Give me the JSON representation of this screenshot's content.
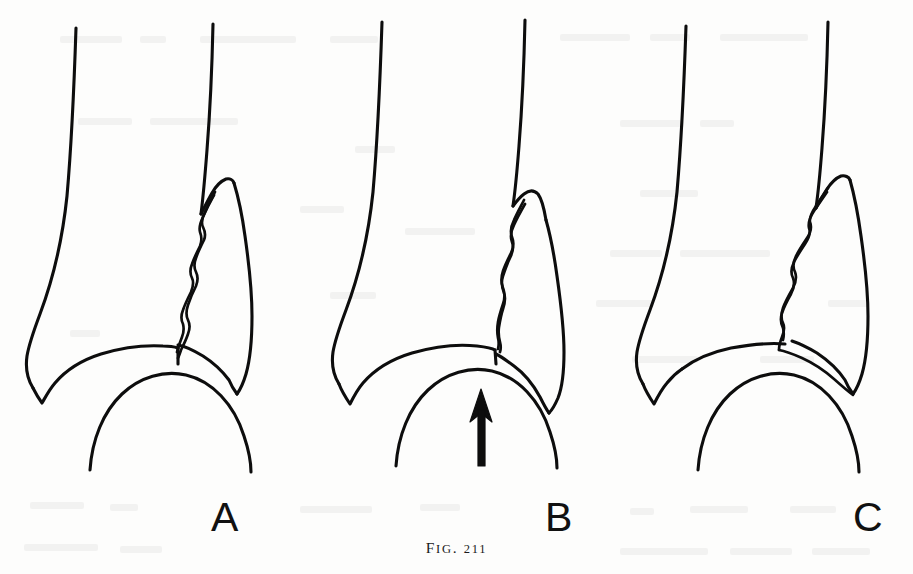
{
  "figure": {
    "caption_prefix": "F",
    "caption_prefix_rest": "IG",
    "caption_punct": ". ",
    "caption_number": "211",
    "caption_full": "FIG. 211",
    "background_color": "#fdfdfc",
    "ink_color": "#0d0d0d"
  },
  "panels": [
    {
      "id": "panel-a",
      "label": "A",
      "subject": "ankle-joint-line-drawing",
      "bones": [
        "tibia",
        "fibula",
        "lateral-malleolus",
        "medial-malleolus",
        "talus-dome"
      ],
      "fracture": "oblique-wavy-fracture-of-lateral-malleolus",
      "arrow": false
    },
    {
      "id": "panel-b",
      "label": "B",
      "subject": "ankle-joint-line-drawing",
      "bones": [
        "tibia",
        "fibula",
        "lateral-malleolus",
        "medial-malleolus",
        "talus-dome"
      ],
      "fracture": "vertical-wavy-fracture-reaching-joint-line",
      "arrow": true,
      "arrow_points_to": "tibial-plafond"
    },
    {
      "id": "panel-c",
      "label": "C",
      "subject": "ankle-joint-line-drawing",
      "bones": [
        "tibia",
        "fibula",
        "lateral-malleolus",
        "medial-malleolus",
        "talus-dome"
      ],
      "fracture": "long-oblique-wavy-fracture-of-lateral-malleolus",
      "arrow": false
    }
  ],
  "labels": {
    "a": "A",
    "b": "B",
    "c": "C"
  }
}
